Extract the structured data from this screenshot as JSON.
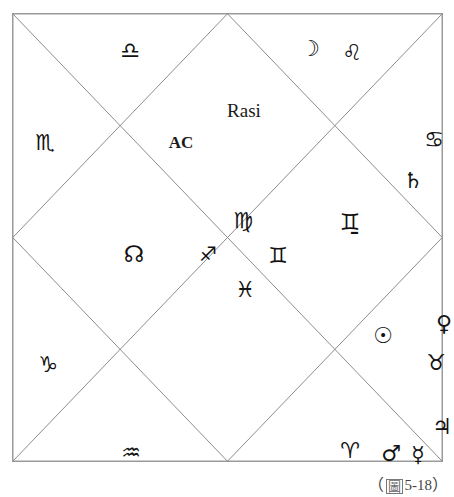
{
  "figure": {
    "kind": "vedic-rasi-chart",
    "style": "north-indian-square",
    "title": "Rasi",
    "ascendant_label": "AC",
    "caption_open_paren": "（",
    "caption_cjk": "圖",
    "caption_number": "5-18",
    "caption_close_paren": "）",
    "line_color": "#8c8c8c",
    "border_color": "#9a9a9a",
    "glyph_color": "#121212",
    "background": "#ffffff"
  },
  "geometry": {
    "frame_x": 12,
    "frame_y": 13,
    "frame_width": 431,
    "frame_height": 449
  },
  "signs": [
    {
      "name": "libra",
      "glyph": "♎",
      "label": "Libra",
      "x": 118,
      "y": 38
    },
    {
      "name": "scorpio",
      "glyph": "♏",
      "label": "Scorpio",
      "x": 33,
      "y": 130
    },
    {
      "name": "sagittarius",
      "glyph": "♐",
      "label": "Sagittarius",
      "x": 196,
      "y": 241
    },
    {
      "name": "capricorn",
      "glyph": "♑",
      "label": "Capricorn",
      "x": 36,
      "y": 352
    },
    {
      "name": "aquarius",
      "glyph": "♒",
      "label": "Aquarius",
      "x": 119,
      "y": 440
    },
    {
      "name": "pisces",
      "glyph": "♓",
      "label": "Pisces",
      "x": 233,
      "y": 277
    },
    {
      "name": "aries",
      "glyph": "♈",
      "label": "Aries",
      "x": 338,
      "y": 438
    },
    {
      "name": "taurus",
      "glyph": "♉",
      "label": "Taurus",
      "x": 424,
      "y": 350
    },
    {
      "name": "gemini",
      "glyph": "♊",
      "label": "Gemini",
      "x": 266,
      "y": 243
    },
    {
      "name": "cancer",
      "glyph": "♋",
      "label": "Cancer",
      "x": 422,
      "y": 127
    },
    {
      "name": "leo",
      "glyph": "♌",
      "label": "Leo",
      "x": 340,
      "y": 40
    },
    {
      "name": "virgo",
      "glyph": "♍",
      "label": "Virgo",
      "x": 231,
      "y": 208
    }
  ],
  "planets": [
    {
      "name": "moon",
      "glyph": "☽",
      "label": "Moon",
      "x": 298,
      "y": 36
    },
    {
      "name": "saturn",
      "glyph": "♄",
      "label": "Saturn",
      "x": 401,
      "y": 168
    },
    {
      "name": "ketu",
      "glyph": "♊̱",
      "alt_glyph": "☿",
      "label": "Ketu",
      "x": 338,
      "y": 209
    },
    {
      "name": "rahu",
      "glyph": "☊",
      "label": "Rahu",
      "x": 122,
      "y": 241
    },
    {
      "name": "sun",
      "glyph": "☉",
      "label": "Sun",
      "x": 371,
      "y": 323
    },
    {
      "name": "venus",
      "glyph": "♀",
      "label": "Venus",
      "x": 432,
      "y": 311
    },
    {
      "name": "jupiter",
      "glyph": "♃",
      "label": "Jupiter",
      "x": 430,
      "y": 414
    },
    {
      "name": "mars",
      "glyph": "♂",
      "label": "Mars",
      "x": 379,
      "y": 441
    },
    {
      "name": "mercury",
      "glyph": "☿",
      "label": "Mercury",
      "x": 406,
      "y": 442
    }
  ],
  "annotations": [
    {
      "name": "chart-title",
      "text": "Rasi",
      "x": 232,
      "y": 97,
      "style": "title"
    },
    {
      "name": "ascendant-label",
      "text": "AC",
      "x": 169,
      "y": 129,
      "style": "ac"
    }
  ]
}
